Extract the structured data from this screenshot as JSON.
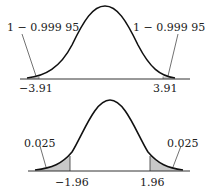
{
  "top_figure": {
    "left_tail_label": "1 − 0.999 95",
    "right_tail_label": "1 − 0.999 95",
    "left_critical": "−3.91",
    "right_critical": "3.91"
  },
  "bottom_figure": {
    "left_tail_label": "0.025",
    "right_tail_label": "0.025",
    "left_critical": "−1.96",
    "right_critical": "1.96"
  },
  "colors": {
    "curve": "#111111",
    "shade": "#c8c8c8",
    "axis": "#333333"
  }
}
